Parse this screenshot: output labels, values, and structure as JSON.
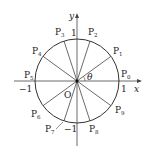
{
  "diagram": {
    "axes": {
      "x_label": "x",
      "y_label": "y",
      "origin_label": "O"
    },
    "ticks": {
      "x_pos": "1",
      "x_neg": "−1",
      "y_pos": "1",
      "y_neg": "−1"
    },
    "angle_label": "θ",
    "points": [
      {
        "name": "P",
        "sub": "0",
        "angle_deg": 0
      },
      {
        "name": "P",
        "sub": "1",
        "angle_deg": 36
      },
      {
        "name": "P",
        "sub": "2",
        "angle_deg": 72
      },
      {
        "name": "P",
        "sub": "3",
        "angle_deg": 108
      },
      {
        "name": "P",
        "sub": "4",
        "angle_deg": 144
      },
      {
        "name": "P",
        "sub": "5",
        "angle_deg": 180
      },
      {
        "name": "P",
        "sub": "6",
        "angle_deg": 216
      },
      {
        "name": "P",
        "sub": "7",
        "angle_deg": 252
      },
      {
        "name": "P",
        "sub": "8",
        "angle_deg": 288
      },
      {
        "name": "P",
        "sub": "9",
        "angle_deg": 324
      }
    ],
    "colors": {
      "stroke": "#333333",
      "text": "#222222",
      "background": "#ffffff"
    }
  }
}
